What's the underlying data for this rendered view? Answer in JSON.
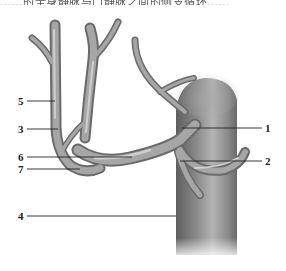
{
  "caption": "……的全身静脉与门静脉之间的侧支循环……",
  "figure": {
    "type": "anatomical-illustration",
    "labels": [
      {
        "id": "1",
        "text": "1"
      },
      {
        "id": "2",
        "text": "2"
      },
      {
        "id": "3",
        "text": "3"
      },
      {
        "id": "4",
        "text": "4"
      },
      {
        "id": "5",
        "text": "5"
      },
      {
        "id": "6",
        "text": "6"
      },
      {
        "id": "7",
        "text": "7"
      }
    ]
  },
  "colors": {
    "vessel_dark": "#6e6e6e",
    "vessel_mid": "#9a9a9a",
    "vessel_light": "#c8c8c8",
    "label_text": "#222222",
    "background": "#ffffff"
  }
}
